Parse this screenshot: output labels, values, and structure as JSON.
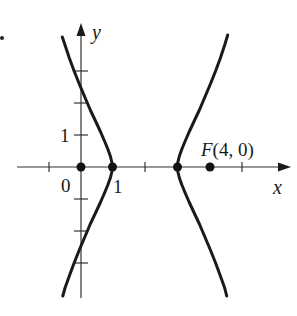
{
  "figure": {
    "type": "hyperbola-graph",
    "equation": "(x-2)^2 - y^2/3 = 1",
    "center": [
      2,
      0
    ],
    "a": 1,
    "b_squared": 3,
    "colors": {
      "ink": "#1a1a1a",
      "axis": "#333333",
      "background": "#ffffff"
    }
  },
  "axes": {
    "x_label": "x",
    "y_label": "y",
    "x_range": [
      -2,
      6.5
    ],
    "y_range": [
      -4.2,
      4.5
    ],
    "x_ticks": [
      -1,
      1,
      2,
      3,
      5
    ],
    "y_ticks": [
      -3,
      -2,
      -1,
      1,
      2,
      3
    ]
  },
  "labels": {
    "origin": "0",
    "x_one": "1",
    "y_one": "1",
    "focus": "F(4, 0)"
  },
  "points": [
    {
      "name": "origin",
      "x": 0,
      "y": 0
    },
    {
      "name": "left-vertex",
      "x": 1,
      "y": 0
    },
    {
      "name": "right-vertex",
      "x": 3,
      "y": 0
    },
    {
      "name": "focus",
      "x": 4,
      "y": 0,
      "label": "F(4, 0)"
    }
  ]
}
